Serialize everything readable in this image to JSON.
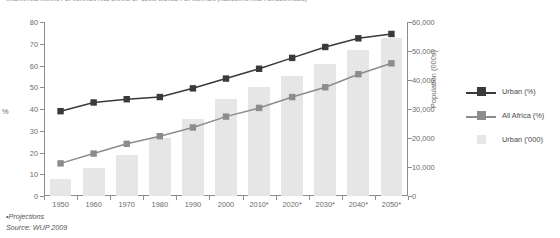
{
  "chart_data": {
    "type": "bar",
    "title": "URBAN AND RURAL POPULATION AND SHARE OF SLUM WORLD POPULATION (ABSOLUTE AND PERCENTAGES)",
    "subtitle": "",
    "xlabel": "",
    "ylabel": "%",
    "ylabel_right": "Population (000s)",
    "ylim": [
      0,
      80
    ],
    "ylim_right": [
      0,
      60000
    ],
    "grid": false,
    "legend_position": "right",
    "categories": [
      "1950",
      "1960",
      "1970",
      "1980",
      "1990",
      "2000",
      "2010*",
      "2020*",
      "2030*",
      "2040*",
      "2050*"
    ],
    "yticks": [
      "0",
      "10",
      "20",
      "30",
      "40",
      "50",
      "60",
      "70",
      "80"
    ],
    "yticks_right": [
      "0",
      "10,000",
      "20,000",
      "30,000",
      "40,000",
      "50,000",
      "60,000"
    ],
    "series": [
      {
        "name": "Urban (%)",
        "type": "line",
        "axis": "left",
        "color": "#3a3a3a",
        "values": [
          39,
          43,
          44.5,
          45.5,
          49.5,
          54,
          58.5,
          63.5,
          68.5,
          72.5,
          74.5
        ]
      },
      {
        "name": "All Africa (%)",
        "type": "line",
        "axis": "left",
        "color": "#8c8c8c",
        "values": [
          15,
          19.5,
          24,
          27.5,
          31.5,
          36.5,
          40.5,
          45.5,
          50,
          56,
          61
        ]
      },
      {
        "name": "Urban ('000)",
        "type": "bar",
        "axis": "right",
        "color": "#e6e6e6",
        "values": [
          6000,
          9500,
          14000,
          20000,
          26500,
          33500,
          37500,
          41500,
          45500,
          50500,
          54500
        ]
      }
    ]
  },
  "legend": {
    "items": [
      {
        "label": "Urban (%)",
        "marker": "line-square",
        "color": "#3a3a3a"
      },
      {
        "label": "All Africa (%)",
        "marker": "line-square",
        "color": "#8c8c8c"
      },
      {
        "label": "Urban ('000)",
        "marker": "swatch",
        "color": "#e6e6e6"
      }
    ]
  },
  "footnotes": {
    "projections": "•Projections",
    "source": "Source: WUP 2009"
  },
  "colors": {
    "urban_pct": "#3a3a3a",
    "all_africa_pct": "#8c8c8c",
    "urban_bars": "#e6e6e6",
    "axis": "#8d8d8d",
    "text": "#6b6b6b",
    "background": "#ffffff"
  }
}
